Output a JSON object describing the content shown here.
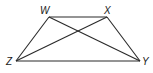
{
  "figure": {
    "type": "trapezoid-with-diagonals",
    "vertices": [
      {
        "name": "W",
        "x": 49,
        "y": 17,
        "label_x": 40,
        "label_y": 14
      },
      {
        "name": "X",
        "x": 107,
        "y": 17,
        "label_x": 104,
        "label_y": 14
      },
      {
        "name": "Y",
        "x": 140,
        "y": 61,
        "label_x": 142,
        "label_y": 65
      },
      {
        "name": "Z",
        "x": 16,
        "y": 61,
        "label_x": 6,
        "label_y": 65
      }
    ],
    "sides": [
      "WX",
      "XY",
      "YZ",
      "ZW"
    ],
    "diagonals": [
      "WY",
      "XZ"
    ],
    "stroke_color": "#2a2a2a"
  }
}
